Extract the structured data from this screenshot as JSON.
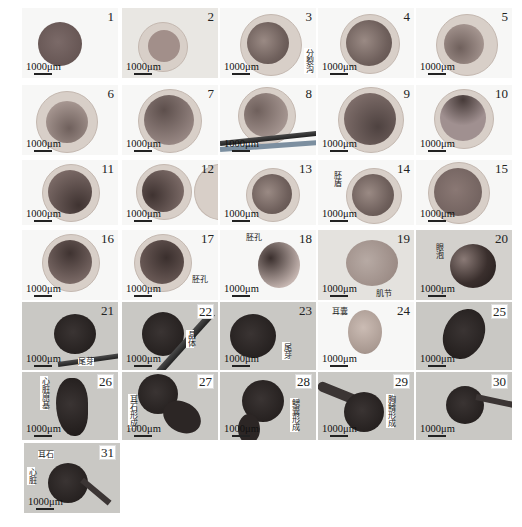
{
  "figure": {
    "scale_label": "1000μm",
    "panels": [
      {
        "n": "1",
        "annotation": ""
      },
      {
        "n": "2",
        "annotation": ""
      },
      {
        "n": "3",
        "annotation": "分裂沟"
      },
      {
        "n": "4",
        "annotation": ""
      },
      {
        "n": "5",
        "annotation": ""
      },
      {
        "n": "6",
        "annotation": ""
      },
      {
        "n": "7",
        "annotation": ""
      },
      {
        "n": "8",
        "annotation": ""
      },
      {
        "n": "9",
        "annotation": ""
      },
      {
        "n": "10",
        "annotation": ""
      },
      {
        "n": "11",
        "annotation": ""
      },
      {
        "n": "12",
        "annotation": ""
      },
      {
        "n": "13",
        "annotation": ""
      },
      {
        "n": "14",
        "annotation": "胚盾"
      },
      {
        "n": "15",
        "annotation": ""
      },
      {
        "n": "16",
        "annotation": ""
      },
      {
        "n": "17",
        "annotation": "胚孔"
      },
      {
        "n": "18",
        "annotation": "胚孔"
      },
      {
        "n": "19",
        "annotation": "肌节"
      },
      {
        "n": "20",
        "annotation": "眼泡"
      },
      {
        "n": "21",
        "annotation": "尾芽"
      },
      {
        "n": "22",
        "annotation": "晶体"
      },
      {
        "n": "23",
        "annotation": "尾芽"
      },
      {
        "n": "24",
        "annotation": "耳囊"
      },
      {
        "n": "25",
        "annotation": ""
      },
      {
        "n": "26",
        "annotation": "心脏原基"
      },
      {
        "n": "27",
        "annotation": "耳石形成"
      },
      {
        "n": "28",
        "annotation": "鳃囊形成"
      },
      {
        "n": "29",
        "annotation": "胸鳍形成"
      },
      {
        "n": "30",
        "annotation": ""
      },
      {
        "n": "31",
        "annotation": "耳石",
        "annotation2": "心脏"
      }
    ]
  }
}
